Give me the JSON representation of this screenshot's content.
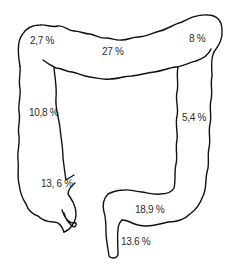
{
  "diagram": {
    "stroke_color": "#111111",
    "background": "#ffffff",
    "segments": [
      {
        "id": "hepatic-flexure",
        "label": "2,7 %"
      },
      {
        "id": "transverse-colon",
        "label": "27 %"
      },
      {
        "id": "splenic-flexure",
        "label": "8 %"
      },
      {
        "id": "ascending-colon",
        "label": "10,8 %"
      },
      {
        "id": "descending-colon",
        "label": "5,4 %"
      },
      {
        "id": "cecum",
        "label": "13, 6 %"
      },
      {
        "id": "sigmoid-colon",
        "label": "18,9 %"
      },
      {
        "id": "rectum",
        "label": "13.6 %"
      }
    ]
  }
}
